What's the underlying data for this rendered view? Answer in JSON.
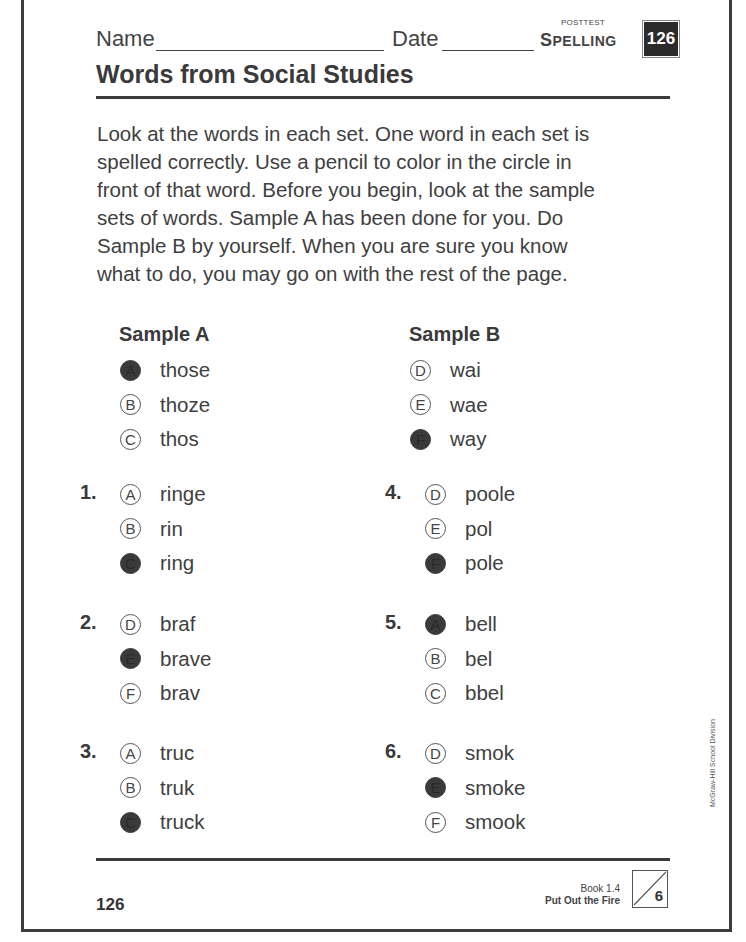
{
  "header": {
    "name_label": "Name",
    "date_label": "Date",
    "test_type": "POSTTEST",
    "subject_first": "S",
    "subject_rest": "PELLING",
    "page_badge": "126"
  },
  "title": "Words from Social Studies",
  "instructions": "Look at the words in each set. One word in each set is spelled correctly. Use a pencil to color in the circle in front of that word. Before you begin, look at the sample sets of words. Sample A has been done for you. Do Sample B by yourself. When you are sure you know what to do, you may go on with the rest of the page.",
  "samples": [
    {
      "title": "Sample A",
      "options": [
        {
          "letter": "A",
          "word": "those",
          "filled": true
        },
        {
          "letter": "B",
          "word": "thoze",
          "filled": false
        },
        {
          "letter": "C",
          "word": "thos",
          "filled": false
        }
      ]
    },
    {
      "title": "Sample B",
      "options": [
        {
          "letter": "D",
          "word": "wai",
          "filled": false
        },
        {
          "letter": "E",
          "word": "wae",
          "filled": false
        },
        {
          "letter": "F",
          "word": "way",
          "filled": true
        }
      ]
    }
  ],
  "questions": [
    {
      "number": "1.",
      "options": [
        {
          "letter": "A",
          "word": "ringe",
          "filled": false
        },
        {
          "letter": "B",
          "word": "rin",
          "filled": false
        },
        {
          "letter": "C",
          "word": "ring",
          "filled": true
        }
      ]
    },
    {
      "number": "2.",
      "options": [
        {
          "letter": "D",
          "word": "braf",
          "filled": false
        },
        {
          "letter": "E",
          "word": "brave",
          "filled": true
        },
        {
          "letter": "F",
          "word": "brav",
          "filled": false
        }
      ]
    },
    {
      "number": "3.",
      "options": [
        {
          "letter": "A",
          "word": "truc",
          "filled": false
        },
        {
          "letter": "B",
          "word": "truk",
          "filled": false
        },
        {
          "letter": "C",
          "word": "truck",
          "filled": true
        }
      ]
    },
    {
      "number": "4.",
      "options": [
        {
          "letter": "D",
          "word": "poole",
          "filled": false
        },
        {
          "letter": "E",
          "word": "pol",
          "filled": false
        },
        {
          "letter": "F",
          "word": "pole",
          "filled": true
        }
      ]
    },
    {
      "number": "5.",
      "options": [
        {
          "letter": "A",
          "word": "bell",
          "filled": true
        },
        {
          "letter": "B",
          "word": "bel",
          "filled": false
        },
        {
          "letter": "C",
          "word": "bbel",
          "filled": false
        }
      ]
    },
    {
      "number": "6.",
      "options": [
        {
          "letter": "D",
          "word": "smok",
          "filled": false
        },
        {
          "letter": "E",
          "word": "smoke",
          "filled": true
        },
        {
          "letter": "F",
          "word": "smook",
          "filled": false
        }
      ]
    }
  ],
  "footer": {
    "page_number": "126",
    "book": "Book 1.4",
    "lesson": "Put Out the Fire",
    "score_total": "6"
  },
  "side_credit": "McGraw-Hill School Division"
}
